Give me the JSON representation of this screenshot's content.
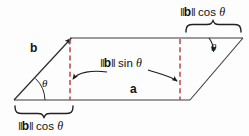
{
  "figure": {
    "background_color": "#fdfdfd",
    "line_color": "#333333",
    "dashed_color": "#c0504d",
    "text_color": "#111111",
    "width": 249,
    "height": 136
  },
  "labels": {
    "vector_b": "b",
    "vector_a": "a",
    "theta_left": "θ",
    "theta_right": "θ",
    "height_expr": {
      "bars_open": "‖",
      "vector": "b",
      "bars_close": "‖",
      "func": "sin",
      "angle": "θ",
      "full": "‖b‖ sin θ"
    },
    "base_expr_left": {
      "bars_open": "‖",
      "vector": "b",
      "bars_close": "‖",
      "func": "cos",
      "angle": "θ",
      "full": "‖b‖ cos θ"
    },
    "base_expr_right": {
      "bars_open": "‖",
      "vector": "b",
      "bars_close": "‖",
      "func": "cos",
      "angle": "θ",
      "full": "‖b‖ cos θ"
    }
  },
  "geometry": {
    "vertex_bottom_left": [
      14,
      100
    ],
    "vertex_bottom_right": [
      190,
      100
    ],
    "vertex_top_left": [
      70,
      38
    ],
    "vertex_top_right": [
      243,
      38
    ],
    "dashed_left_x": 70,
    "dashed_right_x": 180,
    "dashed_top_y": 38,
    "dashed_bottom_y": 100
  }
}
